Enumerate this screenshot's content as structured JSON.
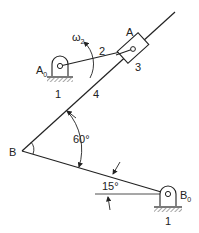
{
  "diagram": {
    "type": "mechanism",
    "labels": {
      "A": "A",
      "A0": "A",
      "A0_sub": "0",
      "B": "B",
      "B0": "B",
      "B0_sub": "0",
      "omega": "ω",
      "omega_sub": "2",
      "link_2": "2",
      "link_3": "3",
      "link_4": "4",
      "ground_A0": "1",
      "ground_B0": "1",
      "angle_60": "60°",
      "angle_15": "15°"
    },
    "stroke_color": "#222222"
  }
}
